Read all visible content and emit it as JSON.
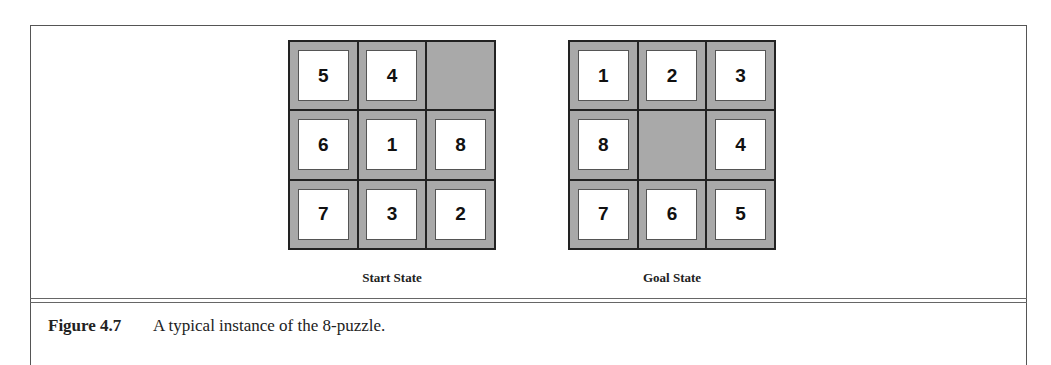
{
  "figure": {
    "number": "Figure 4.7",
    "caption": "A typical instance of the 8-puzzle."
  },
  "puzzles": [
    {
      "label": "Start State",
      "tiles": [
        "5",
        "4",
        "",
        "6",
        "1",
        "8",
        "7",
        "3",
        "2"
      ]
    },
    {
      "label": "Goal State",
      "tiles": [
        "1",
        "2",
        "3",
        "8",
        "",
        "4",
        "7",
        "6",
        "5"
      ]
    }
  ],
  "colors": {
    "board": "#a9a9a9",
    "tile": "#ffffff",
    "border": "#222222"
  }
}
